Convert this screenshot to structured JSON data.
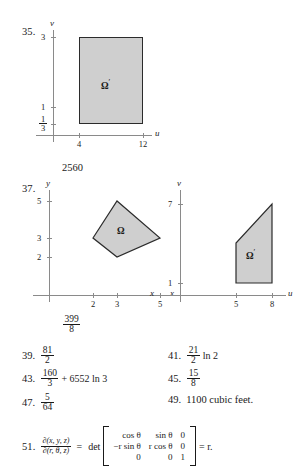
{
  "problems": {
    "p35": {
      "label": "35.",
      "figure": {
        "xaxis_label": "u",
        "yaxis_label": "v",
        "y_ticks": [
          "3",
          "1"
        ],
        "y_tick_fraction": {
          "num": "1",
          "den": "3"
        },
        "x_ticks": [
          "4",
          "12"
        ],
        "region_label": "Ω",
        "region_prime": "′"
      }
    },
    "value_2560": "2560",
    "p37": {
      "label": "37.",
      "left_figure": {
        "xaxis_label": "x",
        "yaxis_label": "y",
        "y_ticks": [
          "5",
          "3",
          "2"
        ],
        "x_ticks": [
          "2",
          "3",
          "5"
        ],
        "region_label": "Ω"
      },
      "right_figure": {
        "xaxis_label": "u",
        "yaxis_label": "v",
        "corner_label": "x",
        "y_ticks": [
          "7",
          "1"
        ],
        "x_ticks": [
          "5",
          "8"
        ],
        "region_label": "Ω",
        "region_prime": "′"
      },
      "answer": {
        "num": "399",
        "den": "8"
      }
    },
    "p39": {
      "label": "39.",
      "num": "81",
      "den": "2"
    },
    "p41": {
      "label": "41.",
      "num": "21",
      "den": "2",
      "suffix": "ln 2"
    },
    "p43": {
      "label": "43.",
      "num": "160",
      "den": "3",
      "suffix": "+ 6552 ln 3"
    },
    "p45": {
      "label": "45.",
      "num": "15",
      "den": "8"
    },
    "p47": {
      "label": "47.",
      "num": "5",
      "den": "64"
    },
    "p49": {
      "label": "49.",
      "text": "1100 cubic feet."
    },
    "p51": {
      "label": "51.",
      "jacobian_num": "∂(x, y, z)",
      "jacobian_den": "∂(r, θ, z)",
      "equals": "=",
      "det_word": "det",
      "matrix": [
        [
          "cos θ",
          "sin θ",
          "0"
        ],
        [
          "−r sin θ",
          "r cos θ",
          "0"
        ],
        [
          "0",
          "0",
          "1"
        ]
      ],
      "result": "= r."
    }
  },
  "colors": {
    "region_fill": "#cfcfcf",
    "region_stroke": "#2b2b2b",
    "axis": "#8a8a8a",
    "text": "#1a1a1a"
  }
}
